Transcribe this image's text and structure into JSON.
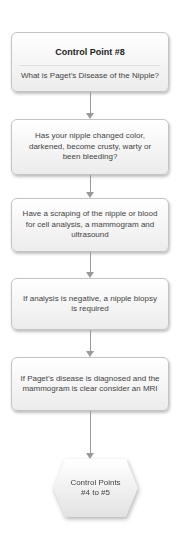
{
  "diagram": {
    "type": "flowchart",
    "colors": {
      "box_fill_top": "#ffffff",
      "box_fill_bottom": "#ececec",
      "box_border": "#c4c4c4",
      "connector": "#9a9a9a",
      "text": "#444444"
    },
    "start": {
      "title": "Control Point #8",
      "subtitle": "What is Paget’s Disease of the Nipple?"
    },
    "steps": [
      {
        "text": "Has your nipple changed color, darkened, become crusty, warty or been bleeding?"
      },
      {
        "text": "Have a scraping of the nipple or blood for cell analysis, a mammogram and ultrasound"
      },
      {
        "text": "If analysis is negative, a nipple biopsy is required"
      },
      {
        "text": "If Paget’s disease is diagnosed and the mammogram is clear consider an MRI"
      }
    ],
    "end": {
      "line1": "Control Points",
      "line2": "#4 to #5"
    }
  }
}
